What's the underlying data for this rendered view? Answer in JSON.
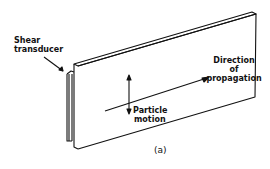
{
  "labels": {
    "transducer": [
      "Shear",
      "transducer"
    ],
    "direction": [
      "Direction",
      "of",
      "propagation"
    ],
    "particle": [
      "Particle",
      "motion"
    ],
    "caption": "(a)"
  },
  "colors": {
    "ink": "#111111",
    "background": "#ffffff"
  }
}
